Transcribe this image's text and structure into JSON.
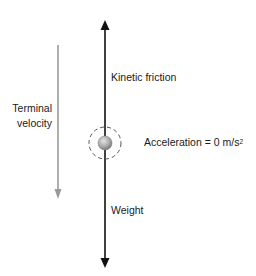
{
  "diagram": {
    "labels": {
      "kinetic_friction": "Kinetic friction",
      "weight": "Weight",
      "terminal_velocity_line1": "Terminal",
      "terminal_velocity_line2": "velocity",
      "acceleration_prefix": "Acceleration = 0  m/s",
      "acceleration_exponent": "2"
    },
    "elements": {
      "force_axis": {
        "x": 105,
        "top_tip_y": 20,
        "bottom_tip_y": 268,
        "color": "#111111"
      },
      "object": {
        "cx": 105,
        "cy": 143,
        "r": 7,
        "fill_light": "#d8d8d8",
        "fill_dark": "#7a7a7a"
      },
      "boundary_circle": {
        "cx": 105,
        "cy": 143,
        "r": 16,
        "color": "#555555",
        "dash": "4 3"
      },
      "velocity_arrow": {
        "x": 58,
        "top_y": 45,
        "bottom_tip_y": 199,
        "color": "#9a9a9a"
      }
    }
  }
}
